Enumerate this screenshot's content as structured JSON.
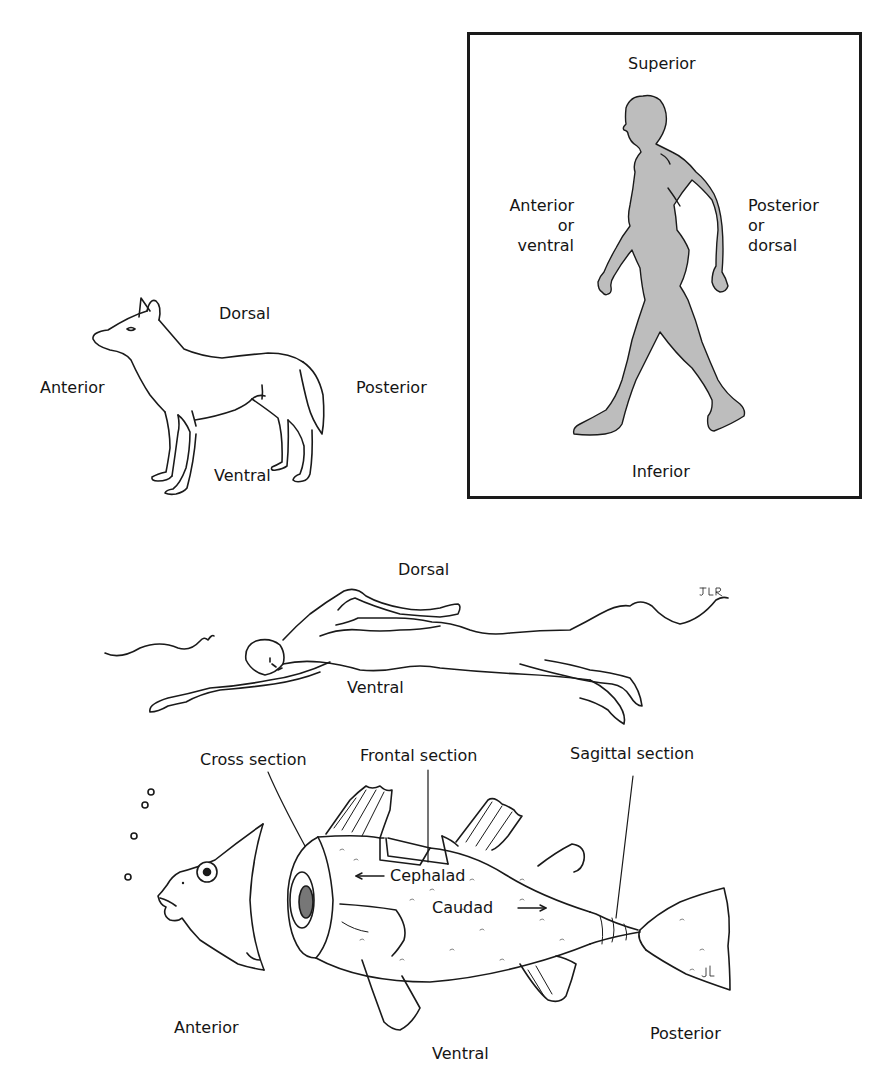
{
  "diagram": {
    "title": "",
    "dog": {
      "labels": {
        "dorsal": "Dorsal",
        "anterior": "Anterior",
        "posterior": "Posterior",
        "ventral": "Ventral"
      }
    },
    "human_standing": {
      "labels": {
        "superior": "Superior",
        "anterior_line1": "Anterior",
        "anterior_line2": "or",
        "anterior_line3": "ventral",
        "posterior_line1": "Posterior",
        "posterior_line2": "or",
        "posterior_line3": "dorsal",
        "inferior": "Inferior"
      },
      "fill_color": "#bdbdbd",
      "framed": true
    },
    "swimmer": {
      "labels": {
        "dorsal": "Dorsal",
        "ventral": "Ventral"
      },
      "signature": "JLR"
    },
    "fish": {
      "labels": {
        "cross_section": "Cross section",
        "frontal_section": "Frontal section",
        "sagittal_section": "Sagittal section",
        "cephalad": "Cephalad",
        "caudad": "Caudad",
        "anterior": "Anterior",
        "ventral": "Ventral",
        "posterior": "Posterior"
      },
      "arrows": {
        "cephalad": "left",
        "caudad": "right"
      },
      "signature": "JL"
    }
  }
}
